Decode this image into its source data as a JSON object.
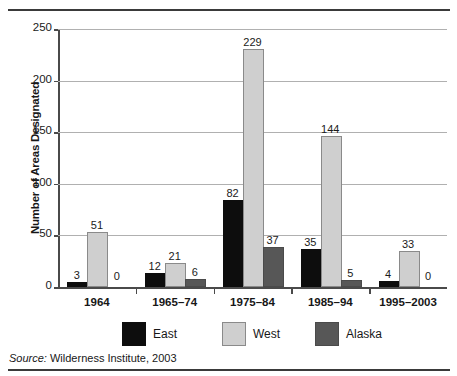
{
  "chart_data": {
    "type": "bar",
    "title": "",
    "xlabel": "",
    "ylabel": "Number of Areas Designated",
    "categories": [
      "1964",
      "1965–74",
      "1975–84",
      "1985–94",
      "1995–2003"
    ],
    "series": [
      {
        "name": "East",
        "color": "#0d0d0d",
        "values": [
          3,
          12,
          82,
          35,
          4
        ]
      },
      {
        "name": "West",
        "color": "#cfcfcf",
        "values": [
          51,
          21,
          229,
          144,
          33
        ]
      },
      {
        "name": "Alaska",
        "color": "#575757",
        "values": [
          0,
          6,
          37,
          5,
          0
        ]
      }
    ],
    "ylim": [
      0,
      250
    ],
    "yticks": [
      0,
      50,
      100,
      150,
      200,
      250
    ],
    "ytick_labels": [
      "0",
      "50",
      "100",
      "150",
      "200",
      "250"
    ],
    "grid": true,
    "legend_position": "bottom",
    "value_labels": true
  },
  "source": {
    "prefix": "Source:",
    "text": " Wilderness Institute, 2003"
  }
}
